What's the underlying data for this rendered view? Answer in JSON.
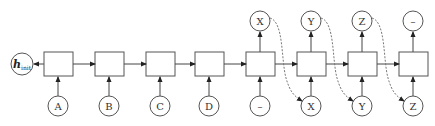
{
  "diagram": {
    "type": "sequence-to-sequence-rnn",
    "initial_state": {
      "label": "h",
      "subscript": "init"
    },
    "cell_count": 8,
    "inputs": [
      "A",
      "B",
      "C",
      "D",
      "–",
      "X",
      "Y",
      "Z"
    ],
    "outputs": [
      "",
      "",
      "",
      "",
      "X",
      "Y",
      "Z",
      "–"
    ],
    "feedback_edges": [
      {
        "from_output": "X",
        "to_input": "X"
      },
      {
        "from_output": "Y",
        "to_input": "Y"
      },
      {
        "from_output": "Z",
        "to_input": "Z"
      }
    ]
  },
  "labels": {
    "h": "h",
    "init": "init",
    "in0": "A",
    "in1": "B",
    "in2": "C",
    "in3": "D",
    "in4": "–",
    "in5": "X",
    "in6": "Y",
    "in7": "Z",
    "out4": "X",
    "out5": "Y",
    "out6": "Z",
    "out7": "–"
  },
  "colors": {
    "stroke": "#555555",
    "text": "#333333",
    "background": "#ffffff"
  }
}
